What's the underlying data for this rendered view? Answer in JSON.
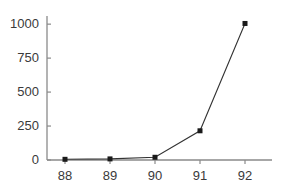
{
  "chart_data": {
    "type": "line",
    "title": "",
    "subtitle": "",
    "xlabel": "",
    "ylabel": "",
    "x": [
      88,
      89,
      90,
      91,
      92
    ],
    "categories": [
      "88",
      "89",
      "90",
      "91",
      "92"
    ],
    "values": [
      5,
      8,
      20,
      215,
      1005
    ],
    "series": [
      {
        "name": "",
        "values": [
          5,
          8,
          20,
          215,
          1005
        ]
      }
    ],
    "xlim": [
      87.6,
      92.6
    ],
    "ylim": [
      0,
      1060
    ],
    "xticks": [
      88,
      89,
      90,
      91,
      92
    ],
    "yticks": [
      0,
      250,
      500,
      750,
      1000
    ],
    "xtick_labels": [
      "88",
      "89",
      "90",
      "91",
      "92"
    ],
    "ytick_labels": [
      "0",
      "250",
      "500",
      "750",
      "1000"
    ],
    "grid": false,
    "legend": false,
    "legend_position": "none",
    "marker": "square",
    "line_color": "#333333",
    "marker_color": "#1a1a1a",
    "axis_color": "#8a8a8a",
    "tick_label_color": "#3a3a3a",
    "background_color": "#ffffff"
  }
}
